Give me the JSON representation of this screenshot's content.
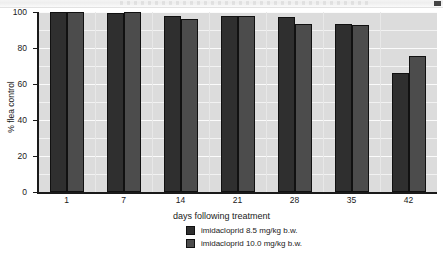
{
  "header": {
    "strip_note": ""
  },
  "chart_data": {
    "type": "bar",
    "title": "",
    "xlabel": "days following treatment",
    "ylabel": "% flea control",
    "categories": [
      "1",
      "7",
      "14",
      "21",
      "28",
      "35",
      "42"
    ],
    "ylim": [
      0,
      100
    ],
    "yticks": [
      "0",
      "20",
      "40",
      "60",
      "80",
      "100"
    ],
    "ytick_values": [
      0,
      20,
      40,
      60,
      80,
      100
    ],
    "grid": true,
    "grid_step": 10,
    "legend_position": "bottom-center",
    "series": [
      {
        "name": "imidacloprid 8.5 mg/kg b.w.",
        "color": "#2f2f2f",
        "values": [
          100,
          99.5,
          98,
          98,
          97,
          93.5,
          66
        ]
      },
      {
        "name": "imidacloprid 10.0 mg/kg b.w.",
        "color": "#4c4c4c",
        "values": [
          100,
          100,
          96,
          98,
          93.5,
          93,
          75.5
        ]
      }
    ]
  },
  "colors": {
    "series_1": "#2f2f2f",
    "series_2": "#4c4c4c",
    "plot_background": "#dcdcdc",
    "page_background": "#ffffff",
    "axis": "#1a1a1a",
    "gridline": "#f2f2f2"
  }
}
